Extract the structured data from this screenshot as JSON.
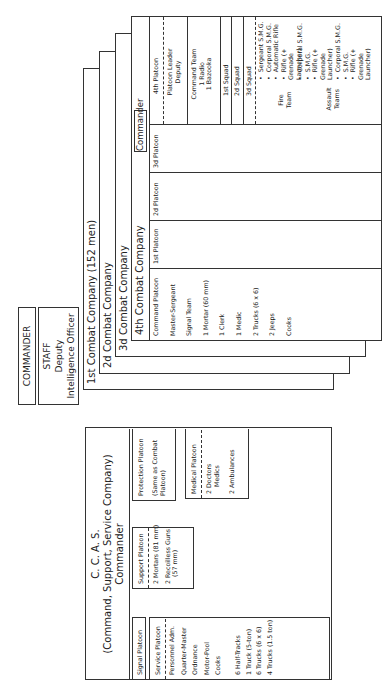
{
  "hq": {
    "commander": "COMMANDER",
    "staff_title": "STAFF",
    "staff_lines": [
      "Deputy",
      "Intelligence Officer"
    ]
  },
  "companies": {
    "first": "1st Combat Company (152 men)",
    "second": "2d Combat Company",
    "third": "3d Combat Company",
    "fourth": "4th Combat Company",
    "commander_label": "Commander",
    "command_platoon": {
      "title": "Command Platoon",
      "items": [
        "Master-Sergeant",
        "Signal Team",
        "1 Mortar (60 mm)",
        "1 Clerk",
        "1 Medic",
        "2 Trucks (6 x 6)",
        "2 Jeeps",
        "Cooks"
      ]
    },
    "platoons": [
      "1st Platoon",
      "2d Platoon",
      "3d Platoon"
    ],
    "fourth_platoon": {
      "title": "4th Platoon",
      "leader": [
        "Platoon Leader",
        "Deputy"
      ],
      "command_team": [
        "Command Team",
        "1 Radio",
        "1 Bazooka"
      ],
      "squads": [
        "1st Squad",
        "2d Squad",
        "3d Squad"
      ],
      "fire_team_label": [
        "Fire",
        "Team"
      ],
      "fire_team_items": [
        "Sergeant S.M.G.",
        "Corporal S.M.G.",
        "Automatic Rifle",
        "Rifle (+ Grenade Launcher)"
      ],
      "assault_label": [
        "Assault",
        "Teams"
      ],
      "assault_items_a": [
        "Corporal S.M.G.",
        "S.M.G.",
        "Rifle (+ Grenade Launcher)"
      ],
      "assault_items_b": [
        "Corporal S.M.G.",
        "S.M.G.",
        "Rifle (+ Grenade Launcher)"
      ]
    }
  },
  "ccas": {
    "title": "C. C. A. S.",
    "subtitle": "(Command, Support, Service Company)",
    "commander": "Commander",
    "signal_platoon": "Signal Platoon",
    "service_platoon": {
      "title": "Service Platoon",
      "staff": [
        "Personnel Adm.",
        "Quarter-Master",
        "Ordnance",
        "Motor-Pool",
        "Cooks"
      ],
      "vehicles": [
        "6 Half-Tracks",
        "1 Truck (5-ton)",
        "6 Trucks (6 x 6)",
        "4 Trucks (1.5 ton)"
      ]
    },
    "support_platoon": {
      "title": "Support Platoon",
      "items": [
        "2 Mortars (81 mm)",
        "2 Recoilless Guns",
        "(57 mm)"
      ]
    },
    "protection_platoon": {
      "title": "Protection Platoon",
      "note": [
        "(Same as Combat",
        "Platoon)"
      ]
    },
    "medical_platoon": {
      "title": "Medical Platoon",
      "items": [
        "2 Doctors",
        "Medics",
        "2 Ambulances"
      ]
    }
  }
}
